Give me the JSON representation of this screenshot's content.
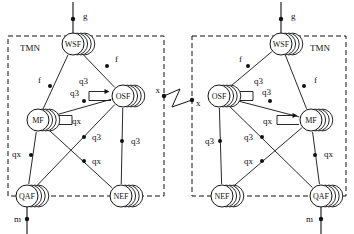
{
  "diagram": {
    "type": "network-reference-diagram",
    "width": 354,
    "height": 234,
    "colors": {
      "stroke": "#111111",
      "background": "#ffffff",
      "dash": "#111111",
      "label": "#111111"
    },
    "boundary_label_left": "TMN",
    "boundary_label_right": "TMN"
  },
  "blocks": [
    {
      "id": "left",
      "label": "TMN",
      "label_x": 20,
      "label_y": 51,
      "box": {
        "x": 8,
        "y": 36,
        "w": 156,
        "h": 160
      },
      "nodes": [
        {
          "id": "wsf-left",
          "label": "WSF",
          "cx": 73,
          "cy": 44,
          "r": 11
        },
        {
          "id": "osf-left",
          "label": "OSF",
          "cx": 123,
          "cy": 96,
          "r": 11
        },
        {
          "id": "mf-left",
          "label": "MF",
          "cx": 38,
          "cy": 120,
          "r": 11
        },
        {
          "id": "qaf-left",
          "label": "QAF",
          "cx": 27,
          "cy": 196,
          "r": 11
        },
        {
          "id": "nef-left",
          "label": "NEF",
          "cx": 121,
          "cy": 196,
          "r": 11
        }
      ],
      "external_links": [
        {
          "id": "g-left",
          "label": "g",
          "label_x": 83,
          "label_y": 19,
          "dot_x": 73,
          "dot_y": 19,
          "x1": 73,
          "y1": 2,
          "x2": 73,
          "y2": 44
        },
        {
          "id": "m-left",
          "label": "m",
          "label_x": 14,
          "label_y": 222,
          "dot_x": 27,
          "dot_y": 219,
          "x1": 27,
          "y1": 196,
          "x2": 27,
          "y2": 234
        }
      ],
      "edges": [
        {
          "id": "wsf-osf-left",
          "from": "wsf-left",
          "to": "osf-left",
          "label": "f",
          "label_x": 115,
          "label_y": 62,
          "dot_x": 107,
          "dot_y": 66
        },
        {
          "id": "wsf-mf-left",
          "from": "wsf-left",
          "to": "mf-left",
          "label": "f",
          "label_x": 38,
          "label_y": 83,
          "dot_x": 50,
          "dot_y": 86
        },
        {
          "id": "mf-osf-left",
          "from": "mf-left",
          "to": "osf-left",
          "label": "q3",
          "label_x": 70,
          "label_y": 96,
          "dot_x": 84,
          "dot_y": 101
        },
        {
          "id": "osf-nef-left",
          "from": "osf-left",
          "to": "nef-left",
          "label": "q3",
          "label_x": 131,
          "label_y": 144,
          "dot_x": 122,
          "dot_y": 141
        },
        {
          "id": "osf-qaf-left",
          "from": "osf-left",
          "to": "qaf-left",
          "label": "q3",
          "label_x": 92,
          "label_y": 140,
          "dot_x": 84,
          "dot_y": 137
        },
        {
          "id": "mf-nef-left",
          "from": "mf-left",
          "to": "nef-left",
          "label": "qx",
          "label_x": 92,
          "label_y": 164,
          "dot_x": 84,
          "dot_y": 161
        },
        {
          "id": "mf-qaf-left",
          "from": "mf-left",
          "to": "qaf-left",
          "label": "qx",
          "label_x": 12,
          "label_y": 157,
          "dot_x": 31,
          "dot_y": 155
        }
      ],
      "self_loops": [
        {
          "id": "osf-loop-left",
          "node": "osf-left",
          "label": "q3",
          "label_x": 88,
          "label_y": 84,
          "side": "left"
        },
        {
          "id": "mf-loop-left",
          "node": "mf-left",
          "label": "qx",
          "label_x": 72,
          "label_y": 124,
          "side": "right"
        }
      ]
    },
    {
      "id": "right",
      "label": "TMN",
      "label_x": 310,
      "label_y": 51,
      "box": {
        "x": 192,
        "y": 36,
        "w": 154,
        "h": 160
      },
      "nodes": [
        {
          "id": "wsf-right",
          "label": "WSF",
          "cx": 281,
          "cy": 44,
          "r": 11
        },
        {
          "id": "osf-right",
          "label": "OSF",
          "cx": 219,
          "cy": 96,
          "r": 11
        },
        {
          "id": "mf-right",
          "label": "MF",
          "cx": 311,
          "cy": 120,
          "r": 11
        },
        {
          "id": "qaf-right",
          "label": "QAF",
          "cx": 321,
          "cy": 196,
          "r": 11
        },
        {
          "id": "nef-right",
          "label": "NEF",
          "cx": 222,
          "cy": 196,
          "r": 11
        }
      ],
      "external_links": [
        {
          "id": "g-right",
          "label": "g",
          "label_x": 291,
          "label_y": 19,
          "dot_x": 281,
          "dot_y": 19,
          "x1": 281,
          "y1": 2,
          "x2": 281,
          "y2": 44
        },
        {
          "id": "m-right",
          "label": "m",
          "label_x": 306,
          "label_y": 222,
          "dot_x": 321,
          "dot_y": 219,
          "x1": 321,
          "y1": 196,
          "x2": 321,
          "y2": 234
        }
      ],
      "edges": [
        {
          "id": "wsf-osf-right",
          "from": "wsf-right",
          "to": "osf-right",
          "label": "f",
          "label_x": 239,
          "label_y": 62,
          "dot_x": 248,
          "dot_y": 66
        },
        {
          "id": "wsf-mf-right",
          "from": "wsf-right",
          "to": "mf-right",
          "label": "f",
          "label_x": 314,
          "label_y": 83,
          "dot_x": 304,
          "dot_y": 86
        },
        {
          "id": "mf-osf-right",
          "from": "mf-right",
          "to": "osf-right",
          "label": "q3",
          "label_x": 262,
          "label_y": 95,
          "dot_x": 270,
          "dot_y": 101
        },
        {
          "id": "osf-nef-right",
          "from": "osf-right",
          "to": "nef-right",
          "label": "q3",
          "label_x": 205,
          "label_y": 144,
          "dot_x": 220,
          "dot_y": 141
        },
        {
          "id": "osf-qaf-right",
          "from": "osf-right",
          "to": "qaf-right",
          "label": "q3",
          "label_x": 244,
          "label_y": 140,
          "dot_x": 262,
          "dot_y": 137
        },
        {
          "id": "mf-nef-right",
          "from": "mf-right",
          "to": "nef-right",
          "label": "qx",
          "label_x": 244,
          "label_y": 164,
          "dot_x": 262,
          "dot_y": 161
        },
        {
          "id": "mf-qaf-right",
          "from": "mf-right",
          "to": "qaf-right",
          "label": "qx",
          "label_x": 324,
          "label_y": 157,
          "dot_x": 315,
          "dot_y": 155
        }
      ],
      "self_loops": [
        {
          "id": "osf-loop-right",
          "node": "osf-right",
          "label": "q3",
          "label_x": 254,
          "label_y": 84,
          "side": "right"
        },
        {
          "id": "mf-loop-right",
          "node": "mf-right",
          "label": "qx",
          "label_x": 272,
          "label_y": 124,
          "side": "left"
        }
      ]
    }
  ],
  "interconnect": {
    "id": "x-interface",
    "label_left": "x",
    "label_right": "x",
    "label_left_x": 160,
    "label_left_y": 93,
    "label_right_x": 196,
    "label_right_y": 106,
    "dot_left_x": 164,
    "dot_left_y": 96,
    "dot_right_x": 192,
    "dot_right_y": 100,
    "zigzag": "M 164,96 L 180,89 L 172,107 L 192,100"
  },
  "legend": {
    "node_names": [
      "WSF",
      "OSF",
      "MF",
      "QAF",
      "NEF"
    ],
    "interface_names": [
      "g",
      "f",
      "q3",
      "qx",
      "m",
      "x"
    ]
  }
}
